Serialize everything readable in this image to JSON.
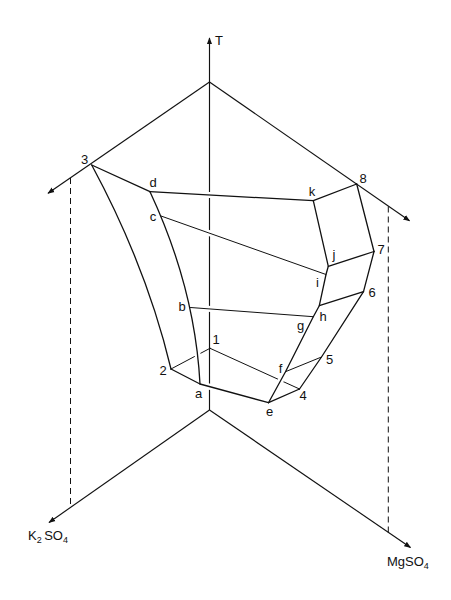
{
  "diagram": {
    "title": "",
    "axes": {
      "temperature": {
        "label": "T"
      },
      "k2so4": {
        "base1": "K",
        "sub1": "2",
        "base2": "SO",
        "sub2": "4"
      },
      "mgso4": {
        "base": "MgSO",
        "sub": "4"
      }
    },
    "points": {
      "n1": "1",
      "n2": "2",
      "n3": "3",
      "n4": "4",
      "n5": "5",
      "n6": "6",
      "n7": "7",
      "n8": "8",
      "a": "a",
      "b": "b",
      "c": "c",
      "d": "d",
      "e": "e",
      "f": "f",
      "g": "g",
      "h": "h",
      "i": "i",
      "j": "j",
      "k": "k"
    },
    "edges": [
      [
        "3",
        "d"
      ],
      [
        "d",
        "k"
      ],
      [
        "k",
        "8"
      ],
      [
        "8",
        "7"
      ],
      [
        "7",
        "6"
      ],
      [
        "6",
        "5"
      ],
      [
        "5",
        "4"
      ],
      [
        "4",
        "e"
      ],
      [
        "e",
        "a"
      ],
      [
        "a",
        "2"
      ],
      [
        "2",
        "3"
      ],
      [
        "d",
        "c"
      ],
      [
        "c",
        "b"
      ],
      [
        "b",
        "a"
      ],
      [
        "k",
        "j"
      ],
      [
        "j",
        "i"
      ],
      [
        "i",
        "h"
      ],
      [
        "h",
        "g"
      ],
      [
        "g",
        "f"
      ],
      [
        "f",
        "e"
      ],
      [
        "j",
        "7"
      ],
      [
        "h",
        "6"
      ],
      [
        "f",
        "5"
      ],
      [
        "c",
        "i"
      ],
      [
        "b",
        "g"
      ],
      [
        "2",
        "1"
      ],
      [
        "1",
        "4"
      ]
    ]
  }
}
